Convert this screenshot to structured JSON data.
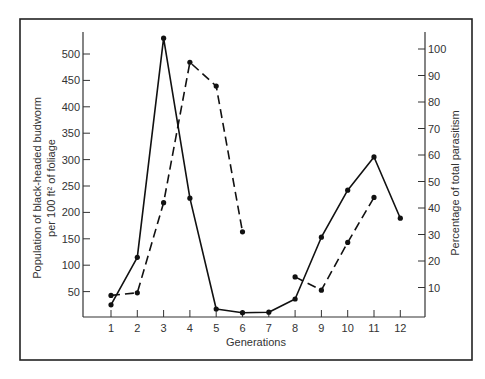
{
  "chart_data": {
    "type": "line",
    "title": "",
    "xlabel": "Generations",
    "ylabel": "Population of black-headed budworm per 100 ft² of foliage",
    "ylabel_lines": [
      "Population of black-headed budworm",
      "per 100 ft² of foliage"
    ],
    "y2label": "Percentage of total parasitism",
    "x": [
      1,
      2,
      3,
      4,
      5,
      6,
      7,
      8,
      9,
      10,
      11,
      12
    ],
    "x_tick_labels": [
      "1",
      "2",
      "3",
      "4",
      "5",
      "6",
      "7",
      "8",
      "9",
      "10",
      "11",
      "12"
    ],
    "y_ticks": [
      50,
      100,
      150,
      200,
      250,
      300,
      350,
      400,
      450,
      500
    ],
    "y2_ticks": [
      10,
      20,
      30,
      40,
      50,
      60,
      70,
      80,
      90,
      100
    ],
    "ylim": [
      0,
      540
    ],
    "y2lim": [
      0,
      106
    ],
    "grid": false,
    "legend": null,
    "series": [
      {
        "name": "Budworm population",
        "axis": "left",
        "style": "solid",
        "x": [
          1,
          2,
          3,
          4,
          5,
          6,
          7,
          8,
          9,
          10,
          11,
          12
        ],
        "values": [
          25,
          115,
          530,
          227,
          17,
          10,
          11,
          36,
          153,
          242,
          305,
          189
        ]
      },
      {
        "name": "Percentage of total parasitism",
        "axis": "right",
        "style": "dashed",
        "segments": [
          {
            "x": [
              1,
              2,
              3,
              4,
              5,
              6
            ],
            "values": [
              7,
              8,
              42,
              95,
              86,
              31
            ]
          },
          {
            "x": [
              8,
              9,
              10,
              11
            ],
            "values": [
              14,
              9,
              27,
              44
            ]
          }
        ]
      }
    ]
  }
}
